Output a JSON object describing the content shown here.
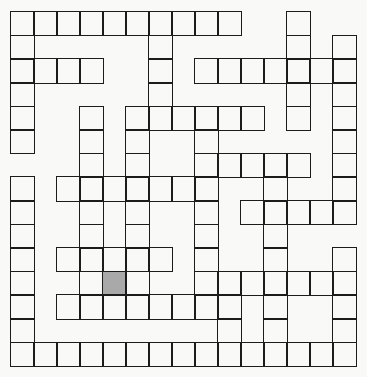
{
  "puzzle": {
    "type": "crossword-grid",
    "rows": 15,
    "cols": 15,
    "colors": {
      "line": "#1c1c1c",
      "background": "#f9f9f8",
      "shaded": "#a9a9a9"
    },
    "white_cells_by_row": [
      [
        0,
        1,
        2,
        3,
        4,
        5,
        6,
        7,
        8,
        9,
        12
      ],
      [
        0,
        6,
        12,
        14
      ],
      [
        0,
        1,
        2,
        3,
        6,
        8,
        9,
        10,
        11,
        12,
        13,
        14
      ],
      [
        0,
        6,
        12,
        14
      ],
      [
        0,
        3,
        5,
        6,
        7,
        8,
        9,
        10,
        12,
        14
      ],
      [
        0,
        3,
        5,
        8,
        14
      ],
      [
        3,
        5,
        8,
        9,
        10,
        11,
        12,
        14
      ],
      [
        0,
        2,
        3,
        4,
        5,
        6,
        7,
        8,
        11,
        14
      ],
      [
        0,
        3,
        5,
        8,
        10,
        11,
        12,
        13,
        14
      ],
      [
        0,
        3,
        5,
        8,
        11
      ],
      [
        0,
        2,
        3,
        4,
        5,
        6,
        8,
        11,
        14
      ],
      [
        0,
        3,
        4,
        5,
        8,
        9,
        10,
        11,
        12,
        13,
        14
      ],
      [
        0,
        2,
        3,
        4,
        5,
        6,
        7,
        8,
        9,
        11,
        14
      ],
      [
        0,
        9,
        11,
        14
      ],
      [
        0,
        1,
        2,
        3,
        4,
        5,
        6,
        7,
        8,
        9,
        10,
        11,
        12,
        13,
        14
      ]
    ],
    "shaded_cells": [
      [
        11,
        4
      ]
    ]
  }
}
